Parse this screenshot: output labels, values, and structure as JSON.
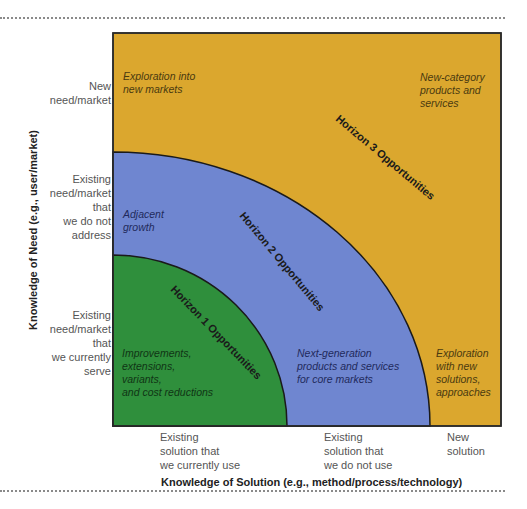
{
  "diagram": {
    "colors": {
      "horizon3": "#dba72e",
      "horizon2": "#6f86d0",
      "horizon1": "#2f8f3c",
      "border": "#222222",
      "text_gray": "#555555"
    },
    "horizons": [
      {
        "label": "Horizon 1 Opportunities"
      },
      {
        "label": "Horizon 2 Opportunities"
      },
      {
        "label": "Horizon 3 Opportunities"
      }
    ],
    "regions": {
      "top_left": [
        "Exploration into",
        "new markets"
      ],
      "top_right": [
        "New-category",
        "products and",
        "services"
      ],
      "mid_left": [
        "Adjacent",
        "growth"
      ],
      "bottom_left": [
        "Improvements,",
        "extensions,",
        "variants,",
        "and cost reductions"
      ],
      "bottom_mid": [
        "Next-generation",
        "products and services",
        "for core markets"
      ],
      "bottom_right": [
        "Exploration",
        "with new",
        "solutions,",
        "approaches"
      ]
    },
    "y_axis": {
      "title": "Knowledge of Need (e.g., user/market)",
      "ticks": [
        [
          "New",
          "need/market"
        ],
        [
          "Existing",
          "need/market",
          "that",
          "we do not",
          "address"
        ],
        [
          "Existing",
          "need/market",
          "that",
          "we currently",
          "serve"
        ]
      ]
    },
    "x_axis": {
      "title": "Knowledge of Solution (e.g., method/process/technology)",
      "ticks": [
        [
          "Existing",
          "solution that",
          "we currently use"
        ],
        [
          "Existing",
          "solution that",
          "we do not use"
        ],
        [
          "New",
          "solution"
        ]
      ]
    }
  }
}
